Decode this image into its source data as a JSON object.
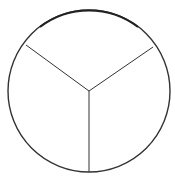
{
  "diagram": {
    "type": "circle-divided-into-three-sectors",
    "sectors": 3,
    "colors": {
      "stroke": "#333333",
      "background": "#ffffff"
    },
    "circle": {
      "cx": 89,
      "cy": 91,
      "r": 81
    },
    "center": {
      "x": 89,
      "y": 91
    },
    "radii_endpoints": [
      {
        "x": 26,
        "y": 45
      },
      {
        "x": 153,
        "y": 47
      },
      {
        "x": 89,
        "y": 172
      }
    ]
  }
}
